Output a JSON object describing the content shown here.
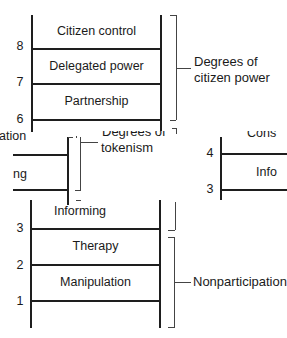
{
  "diagram": {
    "rungs_top": [
      {
        "number": "8",
        "label": "Citizen control"
      },
      {
        "number": "7",
        "label": "Delegated power"
      },
      {
        "number": "6",
        "label": "Partnership"
      }
    ],
    "rungs_bottom": [
      {
        "label": "Informing"
      },
      {
        "number": "3",
        "label": "Therapy"
      },
      {
        "number": "2",
        "label": "Manipulation"
      },
      {
        "number": "1",
        "label": ""
      }
    ],
    "groups": {
      "citizen_power": {
        "line1": "Degrees of",
        "line2": "citizen power"
      },
      "tokenism": {
        "line1": "Degrees of",
        "line2": "tokenism"
      },
      "nonparticipation": {
        "label": "Nonparticipation"
      }
    },
    "overlay_left": {
      "text_top": "ation",
      "text_mid": "ng"
    },
    "overlay_right": {
      "number_4": "4",
      "number_3": "3",
      "text_top": "Cons",
      "text_mid": "Info"
    }
  }
}
